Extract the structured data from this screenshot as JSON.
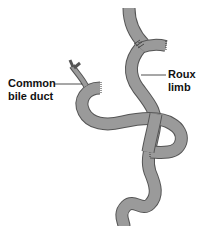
{
  "figure": {
    "labels": {
      "common_bile_duct": [
        "Common",
        "bile duct"
      ],
      "roux_limb": [
        "Roux",
        "limb"
      ]
    },
    "colors": {
      "tube_fill": "#9a9a9a",
      "tube_outline": "#4a4a4a",
      "leader_line": "#222222",
      "background": "#ffffff"
    }
  }
}
